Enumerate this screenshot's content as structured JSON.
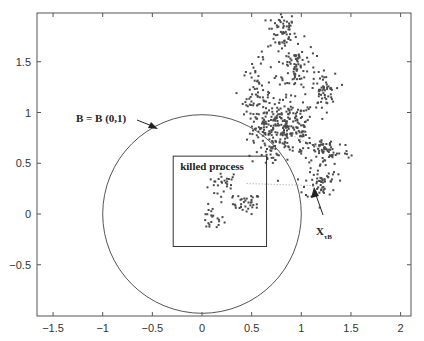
{
  "chart_data": {
    "type": "scatter",
    "title": "",
    "xlabel": "",
    "ylabel": "",
    "xlim": [
      -1.67,
      2.1
    ],
    "ylim": [
      -1.0,
      2.0
    ],
    "grid": false,
    "legend": null,
    "x_ticks": [
      -1.5,
      -1,
      -0.5,
      0,
      0.5,
      1,
      1.5,
      2
    ],
    "x_tick_labels": [
      "−1.5",
      "−1",
      "−0.5",
      "0",
      "0.5",
      "1",
      "1.5",
      "2"
    ],
    "y_ticks": [
      -0.5,
      0,
      0.5,
      1,
      1.5
    ],
    "y_tick_labels": [
      "−0.5",
      "0",
      "0.5",
      "1",
      "1.5"
    ],
    "circle": {
      "label": "B = B (0,1)",
      "center": [
        0,
        0
      ],
      "radius": 1
    },
    "killed_box": {
      "label": "killed process",
      "x0": -0.29,
      "x1": 0.65,
      "y0": -0.32,
      "y1": 0.57
    },
    "exit_point": {
      "label": "X",
      "subscript": "τB",
      "x": 1.12,
      "y": 0.25
    },
    "series": [
      {
        "name": "killed process (inside B)",
        "clusters": [
          {
            "cx": 0.22,
            "cy": 0.3,
            "sx": 0.08,
            "sy": 0.07,
            "n": 30
          },
          {
            "cx": 0.45,
            "cy": 0.1,
            "sx": 0.07,
            "sy": 0.05,
            "n": 35
          },
          {
            "cx": 0.1,
            "cy": -0.05,
            "sx": 0.06,
            "sy": 0.06,
            "n": 22
          }
        ]
      },
      {
        "name": "process after exit (outside B)",
        "clusters": [
          {
            "cx": 0.8,
            "cy": 1.8,
            "sx": 0.07,
            "sy": 0.1,
            "n": 60
          },
          {
            "cx": 0.95,
            "cy": 1.45,
            "sx": 0.1,
            "sy": 0.13,
            "n": 90
          },
          {
            "cx": 0.55,
            "cy": 1.15,
            "sx": 0.07,
            "sy": 0.17,
            "n": 80
          },
          {
            "cx": 0.85,
            "cy": 0.85,
            "sx": 0.15,
            "sy": 0.13,
            "n": 220
          },
          {
            "cx": 1.22,
            "cy": 1.2,
            "sx": 0.06,
            "sy": 0.09,
            "n": 50
          },
          {
            "cx": 1.25,
            "cy": 0.62,
            "sx": 0.12,
            "sy": 0.07,
            "n": 70
          },
          {
            "cx": 1.2,
            "cy": 0.32,
            "sx": 0.08,
            "sy": 0.09,
            "n": 60
          },
          {
            "cx": 0.7,
            "cy": 0.6,
            "sx": 0.04,
            "sy": 0.05,
            "n": 20
          },
          {
            "cx": 0.62,
            "cy": 0.85,
            "sx": 0.05,
            "sy": 0.06,
            "n": 25
          }
        ]
      }
    ],
    "connector_lines": [
      {
        "from": [
          0.45,
          0.3
        ],
        "to": [
          1.12,
          0.28
        ],
        "style": "dotted"
      },
      {
        "from": [
          0.85,
          0.8
        ],
        "to": [
          1.25,
          0.62
        ],
        "style": "dotted"
      }
    ]
  },
  "colors": {
    "axis": "#555555",
    "points": "#4a4a4a",
    "circle": "#555555",
    "text": "#222222",
    "background": "#ffffff"
  },
  "annotations": {
    "circle_label": "B = B (0,1)",
    "box_label": "killed process",
    "exit_label": "X",
    "exit_subscript": "τB"
  }
}
